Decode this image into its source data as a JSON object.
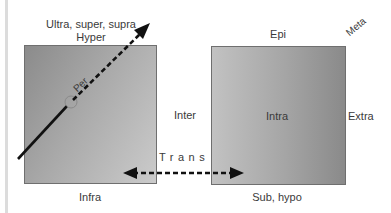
{
  "diagram": {
    "boxes": [
      {
        "id": "left",
        "fill": "gradient gray"
      },
      {
        "id": "right",
        "fill": "gradient gray"
      }
    ],
    "labels": {
      "above_left_line1": "Ultra, super, supra",
      "above_left_line2": "Hyper",
      "per": "Per",
      "inter": "Inter",
      "below_left": "Infra",
      "above_right": "Epi",
      "corner_right": "Meta",
      "inside_right": "Intra",
      "right_side": "Extra",
      "below_right": "Sub, hypo",
      "trans": "Trans"
    },
    "arrows": [
      {
        "name": "per-arrow",
        "from": [
          18,
          159
        ],
        "to": [
          150,
          24
        ],
        "style": "solid then dashed"
      },
      {
        "name": "trans-arrow",
        "from": [
          124,
          173
        ],
        "to": [
          243,
          173
        ],
        "style": "dashed double-headed"
      }
    ],
    "colors": {
      "box_dark": "#8b8b8b",
      "box_light": "#cbcbcb",
      "arrow": "#111111",
      "text": "#3a3a3a"
    }
  }
}
